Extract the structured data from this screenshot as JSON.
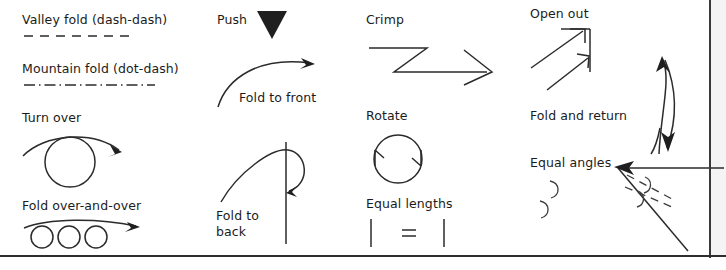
{
  "figure": {
    "kind": "origami-symbols-key",
    "background_color": "#ffffff",
    "ink_color": "#2b2b2b"
  },
  "columns": [
    {
      "name": "column-1",
      "entries": [
        {
          "id": "valley-fold",
          "label": "Valley fold (dash-dash)",
          "glyph": "dashed-line"
        },
        {
          "id": "mountain-fold",
          "label": "Mountain fold (dot-dash)",
          "glyph": "dash-dot-line"
        },
        {
          "id": "turn-over",
          "label": "Turn over",
          "glyph": "circle-with-arc-arrow"
        },
        {
          "id": "fold-over-and-over",
          "label": "Fold over-and-over",
          "glyph": "three-circles-arrow"
        }
      ]
    },
    {
      "name": "column-2",
      "entries": [
        {
          "id": "push",
          "label": "Push",
          "glyph": "filled-down-triangle"
        },
        {
          "id": "fold-to-front",
          "label": "Fold to front",
          "glyph": "curved-arrow-up-right"
        },
        {
          "id": "fold-to-back",
          "label": "Fold to\nback",
          "glyph": "curved-arrow-loop-behind-line"
        }
      ]
    },
    {
      "name": "column-3",
      "entries": [
        {
          "id": "crimp",
          "label": "Crimp",
          "glyph": "zigzag-arrow"
        },
        {
          "id": "rotate",
          "label": "Rotate",
          "glyph": "circle-two-arrowheads"
        },
        {
          "id": "equal-lengths",
          "label": "Equal lengths",
          "glyph": "two-ticks-equals"
        }
      ]
    },
    {
      "name": "column-4",
      "entries": [
        {
          "id": "open-out",
          "label": "Open out",
          "glyph": "two-diagonal-arrows-corner"
        },
        {
          "id": "fold-and-return",
          "label": "Fold and return",
          "glyph": "double-headed-curved-arrow"
        },
        {
          "id": "equal-angles",
          "label": "Equal angles",
          "glyph": "two-arc-marks"
        },
        {
          "id": "angle-bisector",
          "label": "",
          "glyph": "wedge-with-dashed-bisectors"
        }
      ]
    }
  ],
  "labels": {
    "valley_fold": "Valley fold (dash-dash)",
    "mountain_fold": "Mountain fold (dot-dash)",
    "turn_over": "Turn over",
    "fold_over_and_over": "Fold over-and-over",
    "push": "Push",
    "fold_to_front": "Fold to front",
    "fold_to_back_line1": "Fold to",
    "fold_to_back_line2": "back",
    "crimp": "Crimp",
    "rotate": "Rotate",
    "equal_lengths": "Equal lengths",
    "open_out": "Open out",
    "fold_and_return": "Fold and return",
    "equal_angles": "Equal angles"
  }
}
